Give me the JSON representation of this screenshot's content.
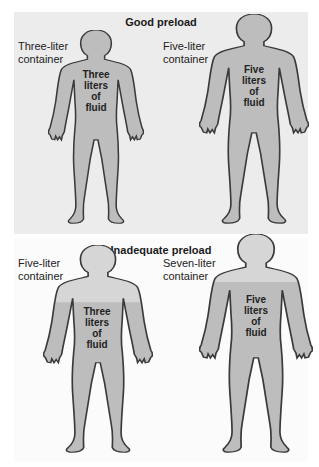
{
  "panels": [
    {
      "title": "Good preload",
      "figures": [
        {
          "container_label_line1": "Three-liter",
          "container_label_line2": "container",
          "fluid_line1": "Three",
          "fluid_line2": "liters",
          "fluid_line3": "of",
          "fluid_line4": "fluid",
          "container_liters": 3,
          "fluid_liters": 3
        },
        {
          "container_label_line1": "Five-liter",
          "container_label_line2": "container",
          "fluid_line1": "Five",
          "fluid_line2": "liters",
          "fluid_line3": "of",
          "fluid_line4": "fluid",
          "container_liters": 5,
          "fluid_liters": 5
        }
      ]
    },
    {
      "title": "Inadequate preload",
      "figures": [
        {
          "container_label_line1": "Five-liter",
          "container_label_line2": "container",
          "fluid_line1": "Three",
          "fluid_line2": "liters",
          "fluid_line3": "of",
          "fluid_line4": "fluid",
          "container_liters": 5,
          "fluid_liters": 3
        },
        {
          "container_label_line1": "Seven-liter",
          "container_label_line2": "container",
          "fluid_line1": "Five",
          "fluid_line2": "liters",
          "fluid_line3": "of",
          "fluid_line4": "fluid",
          "container_liters": 7,
          "fluid_liters": 5
        }
      ]
    }
  ],
  "colors": {
    "fill": "#bdbdbd",
    "empty": "#d6d6d6",
    "outline": "#3a3a3a",
    "top_bg": "#ececec",
    "bottom_bg": "#fbfbfb"
  }
}
